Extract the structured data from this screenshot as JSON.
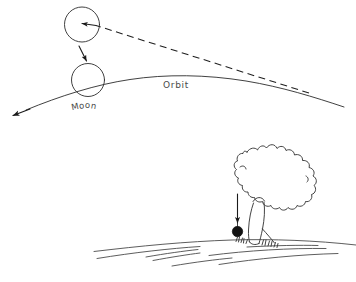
{
  "figure": {
    "background_color": "#ffffff",
    "ink_color": "#2b2b2b",
    "width": 356,
    "height": 282
  },
  "upper_panel": {
    "name": "moon-orbit-panel",
    "labels": {
      "orbit": "Orbit",
      "moon_letters": [
        "M",
        "o",
        "o",
        "n"
      ],
      "moon": "Moon"
    },
    "elements": {
      "tangent_line_style": "dashed",
      "orbit_line_style": "solid-curve-with-arrowhead",
      "moon_displaced_circle": "circle-upper",
      "moon_on_orbit_circle": "circle-lower",
      "deflection_arrow": "short-arrow-down-right",
      "velocity_arrow": "arrowhead-into-upper-circle"
    }
  },
  "lower_panel": {
    "name": "apple-tree-panel",
    "elements": {
      "tree": "oak-tree-outline",
      "apple": "falling-apple",
      "fall_arrow": "arrow-down-into-apple",
      "ground": "curved-earth-surface-lines",
      "grass": "grass-tufts-at-trunk-base"
    }
  }
}
